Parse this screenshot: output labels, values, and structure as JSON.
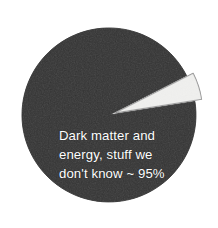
{
  "figure": {
    "background_color": "#ffffff",
    "width": 218,
    "height": 228
  },
  "chart_data": {
    "type": "pie",
    "title": "",
    "subtitle": "",
    "xlabel": "",
    "ylabel": "",
    "legend_position": "none",
    "grid": false,
    "total_percent": 100,
    "categories": [
      "Dark matter and energy, stuff we don't know",
      "Ordinary matter"
    ],
    "values": [
      95,
      5
    ],
    "labels": [
      "Dark matter and energy, stuff we don't know ~ 95%",
      ""
    ],
    "annotations": [
      "Dark matter and",
      "energy, stuff we",
      "don't know ~ 95%"
    ],
    "slices": [
      {
        "name": "dark-matter-and-energy",
        "percent": 95,
        "fill_color": "#2b2b2b",
        "stroke_color": "#2b2b2b",
        "exploded": false,
        "label_inside": true,
        "label_color": "#ffffff"
      },
      {
        "name": "ordinary-matter",
        "percent": 5,
        "fill_color": "#e9e9e6",
        "stroke_color": "#8e8e8e",
        "exploded": true,
        "label_inside": false,
        "label_color": "#2b2b2b"
      }
    ],
    "geometry": {
      "center_x": 109,
      "center_y": 115,
      "radius": 87,
      "start_angle_deg": -9,
      "explode_offset_px": 7,
      "slice_span_deg": 18
    }
  },
  "label": {
    "line1": "Dark matter and",
    "line2": "energy, stuff we",
    "line3": "don't know ~ 95%",
    "color": "#ffffff"
  },
  "colors": {
    "dark_slice": "#2b2b2b",
    "light_slice": "#e9e9e6",
    "light_slice_outline": "#8e8e8e",
    "background": "#ffffff",
    "label_text": "#ffffff"
  }
}
